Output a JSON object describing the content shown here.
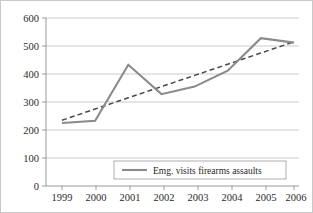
{
  "chart_data": {
    "type": "line",
    "title": "",
    "xlabel": "",
    "ylabel": "",
    "categories": [
      "1999",
      "2000",
      "2001",
      "2002",
      "2003",
      "2004",
      "2005",
      "2006"
    ],
    "x": [
      1999,
      2000,
      2001,
      2002,
      2003,
      2004,
      2005,
      2006
    ],
    "ylim": [
      0,
      600
    ],
    "yticks": [
      0,
      100,
      200,
      300,
      400,
      500,
      600
    ],
    "ytick_labels": [
      "0",
      "100",
      "200",
      "300",
      "400",
      "500",
      "600"
    ],
    "grid": "horizontal",
    "legend_position": "bottom-center",
    "series": [
      {
        "name": "Emg. visits firearms assaults",
        "style": "solid",
        "color": "#8a8a8a",
        "values": [
          225,
          233,
          433,
          328,
          355,
          412,
          528,
          512
        ]
      },
      {
        "name": "linear trendline",
        "style": "dashed",
        "color": "#4a4a4a",
        "show_in_legend": false,
        "values": [
          235,
          275,
          315,
          355,
          395,
          435,
          475,
          515
        ]
      }
    ]
  },
  "legend": {
    "entries": [
      {
        "label": "Emg. visits firearms assaults",
        "swatch": "line-swatch-solid-gray"
      }
    ]
  },
  "axes": {
    "y_labels": [
      "600",
      "500",
      "400",
      "300",
      "200",
      "100",
      "0"
    ],
    "x_labels": [
      "1999",
      "2000",
      "2001",
      "2002",
      "2003",
      "2004",
      "2005",
      "2006"
    ]
  },
  "colors": {
    "series": "#8a8a8a",
    "trend": "#4a4a4a",
    "grid": "#b6b6b6",
    "axis": "#8e8e8e",
    "text": "#2b2b2b",
    "background": "#ffffff",
    "border": "#c9c9c9"
  }
}
